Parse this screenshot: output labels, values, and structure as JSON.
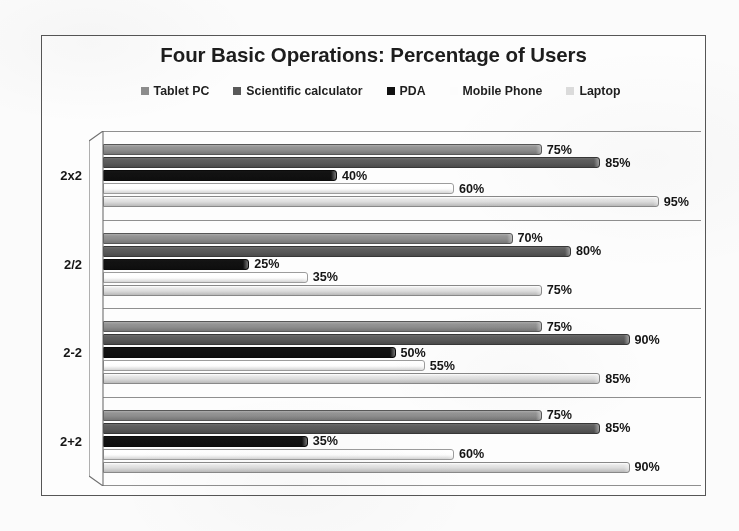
{
  "chart_data": {
    "type": "bar",
    "orientation": "horizontal",
    "title": "Four Basic Operations: Percentage of Users",
    "xlabel": "",
    "ylabel": "",
    "xlim": [
      0,
      100
    ],
    "grid": false,
    "legend_position": "top",
    "value_suffix": "%",
    "categories": [
      "2x2",
      "2/2",
      "2-2",
      "2+2"
    ],
    "series": [
      {
        "name": "Tablet PC",
        "color": "#8d8d8d",
        "values": [
          75,
          70,
          75,
          75
        ],
        "labels": [
          "75%",
          "70%",
          "75%",
          "75%"
        ]
      },
      {
        "name": "Scientific calculator",
        "color": "#595959",
        "values": [
          85,
          80,
          90,
          85
        ],
        "labels": [
          "85%",
          "80%",
          "90%",
          "85%"
        ]
      },
      {
        "name": "PDA",
        "color": "#111111",
        "values": [
          40,
          25,
          50,
          35
        ],
        "labels": [
          "40%",
          "25%",
          "50%",
          "35%"
        ]
      },
      {
        "name": "Mobile Phone",
        "color": "#fcfcfc",
        "values": [
          60,
          35,
          55,
          60
        ],
        "labels": [
          "60%",
          "35%",
          "55%",
          "60%"
        ]
      },
      {
        "name": "Laptop",
        "color": "#dcdcdc",
        "values": [
          95,
          75,
          85,
          90
        ],
        "labels": [
          "95%",
          "75%",
          "85%",
          "90%"
        ]
      }
    ]
  },
  "frame": {
    "border_color": "#55565a"
  }
}
